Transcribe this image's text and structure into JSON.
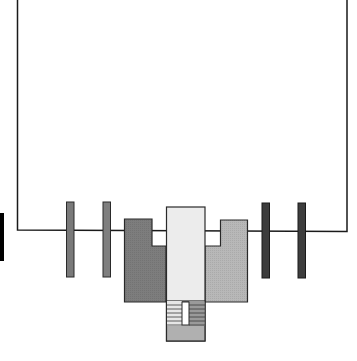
{
  "diagram": {
    "type": "architectural-plan",
    "colors": {
      "background": "#ffffff",
      "outline": "#1a1a1a",
      "left_pillars": "#7a7a7a",
      "right_pillars": "#3c3c3c",
      "left_wing": "#7d7d7d",
      "right_wing": "#b8b8b8",
      "central_block": "#ececec",
      "stair_base": "#b0b0b0",
      "marker_bar": "#000000"
    },
    "elements": [
      {
        "name": "enclosure-outline",
        "kind": "open-rectangle"
      },
      {
        "name": "pillar-left-1",
        "kind": "pillar"
      },
      {
        "name": "pillar-left-2",
        "kind": "pillar"
      },
      {
        "name": "pillar-right-1",
        "kind": "pillar"
      },
      {
        "name": "pillar-right-2",
        "kind": "pillar"
      },
      {
        "name": "left-wing",
        "kind": "notched-block"
      },
      {
        "name": "right-wing",
        "kind": "notched-block"
      },
      {
        "name": "central-block",
        "kind": "tower"
      },
      {
        "name": "staircase",
        "kind": "stairs",
        "steps_per_side": 6
      },
      {
        "name": "marker-bar",
        "kind": "edge-marker"
      }
    ]
  }
}
